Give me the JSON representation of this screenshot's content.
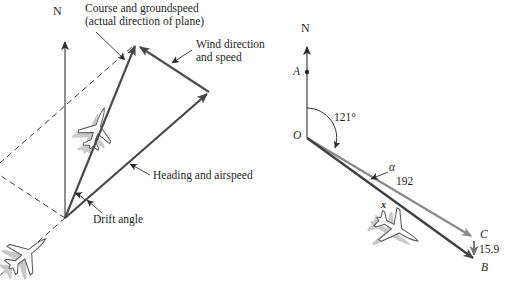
{
  "left_diagram": {
    "north": "N",
    "course_line1": "Course and groundspeed",
    "course_line2": "(actual direction of plane)",
    "wind_line1": "Wind direction",
    "wind_line2": "and speed",
    "heading": "Heading and airspeed",
    "drift": "Drift angle"
  },
  "right_diagram": {
    "north": "N",
    "point_a": "A",
    "point_o": "O",
    "point_c": "C",
    "point_b": "B",
    "bearing_angle": "121°",
    "drift_angle": "α",
    "airspeed": "192",
    "wind_speed": "15.9",
    "plane_mark": "x"
  },
  "colors": {
    "background": "#ffffff",
    "vector_dark": "#4a4a4a",
    "vector_light": "#8a8a8a",
    "thin_line": "#333333",
    "text": "#1f1f1f",
    "plane_shadow": "#c9c9c9"
  }
}
